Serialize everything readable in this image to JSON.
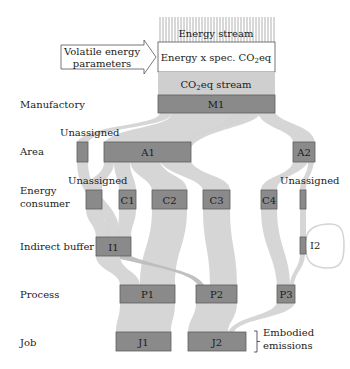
{
  "header": {
    "energy_stream": "Energy stream",
    "energy_times_factor": "Energy x spec. CO",
    "energy_times_factor_sub": "2",
    "energy_times_factor_suffix": "eq",
    "co2_stream_prefix": "CO",
    "co2_stream_sub": "2",
    "co2_stream_suffix": "eq stream",
    "volatile_line1": "Volatile energy",
    "volatile_line2": "parameters"
  },
  "rows": {
    "manufactory": "Manufactory",
    "area": "Area",
    "consumer_line1": "Energy",
    "consumer_line2": "consumer",
    "buffer": "Indirect buffer",
    "process": "Process",
    "job": "Job"
  },
  "nodes": {
    "m1": "M1",
    "a1": "A1",
    "a2": "A2",
    "c1": "C1",
    "c2": "C2",
    "c3": "C3",
    "c4": "C4",
    "i1": "I1",
    "i2": "I2",
    "p1": "P1",
    "p2": "P2",
    "p3": "P3",
    "j1": "J1",
    "j2": "J2"
  },
  "annotations": {
    "unassigned_area": "Unassigned",
    "unassigned_consumer_left": "Unassigned",
    "unassigned_consumer_right": "Unassigned",
    "embodied_line1": "Embodied",
    "embodied_line2": "emissions"
  },
  "colors": {
    "node_fill": "#8a8a8a",
    "flow_fill": "#d4d4d4",
    "co2_stream_fill": "#cfcfcf"
  }
}
